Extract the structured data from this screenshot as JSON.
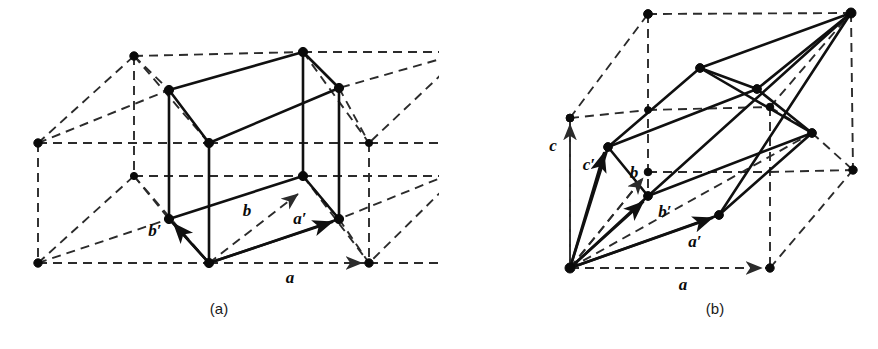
{
  "figure": {
    "background_color": "#ffffff",
    "line_color": "#101010",
    "dash_color": "#2b2b2b",
    "node_color": "#0a0a0a"
  },
  "panels": [
    {
      "id": "a",
      "caption": "(a)",
      "caption_pos": {
        "x": 219,
        "y": 314
      },
      "description": "Orthorhombic C-centered lattice with reduced primitive cell outlined in solid lines",
      "vectors": [
        {
          "name": "a",
          "label": "a",
          "style": "dashed",
          "label_pos": {
            "x": 290,
            "y": 283
          },
          "from": {
            "x": 209,
            "y": 263
          },
          "to": {
            "x": 369,
            "y": 263
          }
        },
        {
          "name": "b",
          "label": "b",
          "style": "dashed",
          "label_pos": {
            "x": 247,
            "y": 216
          },
          "from": {
            "x": 209,
            "y": 263
          },
          "to": {
            "x": 303,
            "y": 190
          }
        },
        {
          "name": "a-prime",
          "label": "a′",
          "style": "solid",
          "label_pos": {
            "x": 300,
            "y": 224
          },
          "from": {
            "x": 209,
            "y": 263
          },
          "to": {
            "x": 339,
            "y": 219
          }
        },
        {
          "name": "b-prime",
          "label": "b′",
          "style": "solid",
          "label_pos": {
            "x": 155,
            "y": 236
          },
          "from": {
            "x": 209,
            "y": 263
          },
          "to": {
            "x": 169,
            "y": 219
          }
        }
      ],
      "nodes": [
        {
          "x": 134,
          "y": 56
        },
        {
          "x": 303,
          "y": 52
        },
        {
          "x": 465,
          "y": 52
        },
        {
          "x": 169,
          "y": 90
        },
        {
          "x": 339,
          "y": 88
        },
        {
          "x": 38,
          "y": 143
        },
        {
          "x": 209,
          "y": 143
        },
        {
          "x": 369,
          "y": 143
        },
        {
          "x": 134,
          "y": 176
        },
        {
          "x": 303,
          "y": 176
        },
        {
          "x": 465,
          "y": 168
        },
        {
          "x": 169,
          "y": 219
        },
        {
          "x": 339,
          "y": 219
        },
        {
          "x": 38,
          "y": 263
        },
        {
          "x": 209,
          "y": 263
        },
        {
          "x": 369,
          "y": 263
        }
      ]
    },
    {
      "id": "b",
      "caption": "(b)",
      "caption_pos": {
        "x": 715,
        "y": 314
      },
      "description": "Rhombohedral primitive cell inscribed in a dashed orthohexagonal reference box",
      "vectors": [
        {
          "name": "a",
          "label": "a",
          "style": "dashed",
          "label_pos": {
            "x": 683,
            "y": 290
          },
          "from": {
            "x": 570,
            "y": 268
          },
          "to": {
            "x": 770,
            "y": 268
          }
        },
        {
          "name": "c",
          "label": "c",
          "style": "dashed",
          "label_pos": {
            "x": 553,
            "y": 151
          },
          "from": {
            "x": 570,
            "y": 268
          },
          "to": {
            "x": 570,
            "y": 118
          }
        },
        {
          "name": "b",
          "label": "b",
          "style": "dashed",
          "label_pos": {
            "x": 634,
            "y": 178
          },
          "from": {
            "x": 570,
            "y": 268
          },
          "to": {
            "x": 648,
            "y": 172
          }
        },
        {
          "name": "a-prime",
          "label": "a′",
          "style": "solid",
          "label_pos": {
            "x": 695,
            "y": 247
          },
          "from": {
            "x": 570,
            "y": 268
          },
          "to": {
            "x": 719,
            "y": 215
          }
        },
        {
          "name": "b-prime",
          "label": "b′",
          "style": "solid",
          "label_pos": {
            "x": 662,
            "y": 215
          },
          "from": {
            "x": 570,
            "y": 268
          },
          "to": {
            "x": 648,
            "y": 196
          }
        },
        {
          "name": "c-prime",
          "label": "c′",
          "style": "solid",
          "label_pos": {
            "x": 589,
            "y": 170
          },
          "from": {
            "x": 570,
            "y": 268
          },
          "to": {
            "x": 608,
            "y": 147
          }
        }
      ],
      "nodes": [
        {
          "x": 648,
          "y": 14
        },
        {
          "x": 851,
          "y": 13
        },
        {
          "x": 700,
          "y": 68
        },
        {
          "x": 757,
          "y": 89
        },
        {
          "x": 570,
          "y": 118
        },
        {
          "x": 648,
          "y": 110
        },
        {
          "x": 770,
          "y": 107
        },
        {
          "x": 608,
          "y": 147
        },
        {
          "x": 812,
          "y": 133
        },
        {
          "x": 648,
          "y": 172
        },
        {
          "x": 853,
          "y": 170
        },
        {
          "x": 648,
          "y": 196
        },
        {
          "x": 719,
          "y": 215
        },
        {
          "x": 570,
          "y": 268
        },
        {
          "x": 770,
          "y": 268
        }
      ]
    }
  ]
}
